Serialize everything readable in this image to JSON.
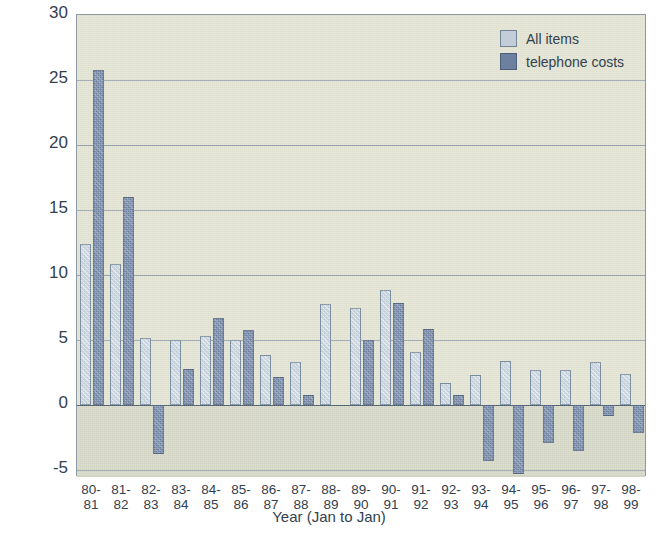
{
  "chart_data": {
    "type": "bar",
    "title": "",
    "xlabel": "Year (Jan to Jan)",
    "ylabel": "% annual change (Jan to Jan)",
    "ylim": [
      -5.5,
      30
    ],
    "yticks": [
      30,
      25,
      20,
      15,
      10,
      5,
      0,
      -5
    ],
    "ytick_labels": [
      "30",
      "25",
      "20",
      "15",
      "10",
      "5",
      "0",
      "-5"
    ],
    "grid": true,
    "legend_position": "top-right",
    "categories": [
      "80-81",
      "81-82",
      "82-83",
      "83-84",
      "84-85",
      "85-86",
      "86-87",
      "87-88",
      "88-89",
      "89-90",
      "90-91",
      "91-92",
      "92-93",
      "93-94",
      "94-95",
      "95-96",
      "96-97",
      "97-98",
      "98-99"
    ],
    "category_lines": [
      [
        "80-",
        "81"
      ],
      [
        "81-",
        "82"
      ],
      [
        "82-",
        "83"
      ],
      [
        "83-",
        "84"
      ],
      [
        "84-",
        "85"
      ],
      [
        "85-",
        "86"
      ],
      [
        "86-",
        "87"
      ],
      [
        "87-",
        "88"
      ],
      [
        "88-",
        "89"
      ],
      [
        "89-",
        "90"
      ],
      [
        "90-",
        "91"
      ],
      [
        "91-",
        "92"
      ],
      [
        "92-",
        "93"
      ],
      [
        "93-",
        "94"
      ],
      [
        "94-",
        "95"
      ],
      [
        "95-",
        "96"
      ],
      [
        "96-",
        "97"
      ],
      [
        "97-",
        "98"
      ],
      [
        "98-",
        "99"
      ]
    ],
    "series": [
      {
        "name": "All items",
        "color": "#c2cdd8",
        "values": [
          12.4,
          10.9,
          5.2,
          5.0,
          5.3,
          5.0,
          3.9,
          3.3,
          7.8,
          7.5,
          8.9,
          4.1,
          1.7,
          2.3,
          3.4,
          2.7,
          2.7,
          3.3,
          2.4
        ]
      },
      {
        "name": "telephone costs",
        "color": "#6d80a0",
        "values": [
          25.8,
          16.0,
          -3.7,
          2.8,
          6.7,
          5.8,
          2.2,
          0.8,
          null,
          5.0,
          7.9,
          5.9,
          0.8,
          -4.3,
          -5.3,
          -2.9,
          -3.5,
          -0.8,
          -2.1
        ]
      }
    ]
  },
  "legend": {
    "items": [
      {
        "label": "All items",
        "swatch": "light"
      },
      {
        "label": "telephone costs",
        "swatch": "dark"
      }
    ]
  }
}
